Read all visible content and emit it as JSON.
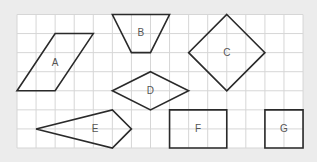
{
  "diagram": {
    "grid": {
      "origin_x": 17,
      "origin_y": 14.5,
      "cell": 19.07,
      "cols": 15,
      "rows": 7,
      "background": "#ffffff",
      "line_color": "#d6d6d6"
    },
    "stroke_color": "#2a2a2a",
    "label_color": "#555555",
    "shapes": [
      {
        "label": "A",
        "type": "parallelogram",
        "points": [
          [
            2,
            1
          ],
          [
            4,
            1
          ],
          [
            2,
            4
          ],
          [
            0,
            4
          ]
        ],
        "label_pos": [
          2,
          2.5
        ]
      },
      {
        "label": "B",
        "type": "trapezoid",
        "points": [
          [
            5,
            0
          ],
          [
            8,
            0
          ],
          [
            7,
            2
          ],
          [
            6,
            2
          ]
        ],
        "label_pos": [
          6.5,
          0.95
        ]
      },
      {
        "label": "C",
        "type": "square-diamond",
        "points": [
          [
            11,
            0
          ],
          [
            13,
            2
          ],
          [
            11,
            4
          ],
          [
            9,
            2
          ]
        ],
        "label_pos": [
          11,
          2
        ]
      },
      {
        "label": "D",
        "type": "rhombus",
        "points": [
          [
            7,
            3
          ],
          [
            9,
            4
          ],
          [
            7,
            5
          ],
          [
            5,
            4
          ]
        ],
        "label_pos": [
          7,
          4
        ]
      },
      {
        "label": "E",
        "type": "kite",
        "points": [
          [
            1,
            6
          ],
          [
            5,
            5
          ],
          [
            6,
            6
          ],
          [
            5,
            7
          ]
        ],
        "label_pos": [
          4.1,
          6
        ]
      },
      {
        "label": "F",
        "type": "rectangle",
        "points": [
          [
            8,
            5
          ],
          [
            11,
            5
          ],
          [
            11,
            7
          ],
          [
            8,
            7
          ]
        ],
        "label_pos": [
          9.5,
          6
        ]
      },
      {
        "label": "G",
        "type": "square",
        "points": [
          [
            13,
            5
          ],
          [
            15,
            5
          ],
          [
            15,
            7
          ],
          [
            13,
            7
          ]
        ],
        "label_pos": [
          14,
          6
        ]
      }
    ]
  }
}
